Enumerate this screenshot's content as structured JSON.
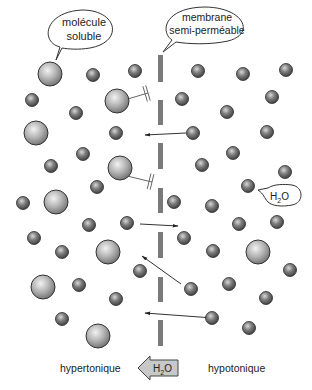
{
  "callouts": {
    "solute": {
      "line1": "molécule",
      "line2": "soluble"
    },
    "membrane": {
      "line1": "membrane",
      "line2": "semi-perméable"
    },
    "water": {
      "text": "H",
      "sub": "2",
      "tail": "O"
    }
  },
  "labels": {
    "left_side": "hypertonique",
    "right_side": "hypotonique",
    "flow_arrow": {
      "text": "H",
      "sub": "2",
      "tail": "O"
    }
  },
  "colors": {
    "membrane": "#7a7a7a",
    "large_molecule": "#a9a9a9",
    "small_molecule": "#6e6e6e",
    "arrow_fill": "#c8c8c8",
    "outline": "#333333"
  },
  "membrane": {
    "x": 158,
    "width": 5,
    "segments": [
      [
        55,
        82
      ],
      [
        100,
        125
      ],
      [
        143,
        169
      ],
      [
        188,
        213
      ],
      [
        232,
        258
      ],
      [
        277,
        302
      ],
      [
        320,
        346
      ]
    ]
  },
  "molecules": {
    "large": [
      [
        50,
        74
      ],
      [
        117,
        101
      ],
      [
        36,
        133
      ],
      [
        120,
        168
      ],
      [
        56,
        202
      ],
      [
        108,
        252
      ],
      [
        43,
        287
      ],
      [
        98,
        336
      ],
      [
        258,
        252
      ]
    ],
    "small": [
      [
        93,
        75
      ],
      [
        135,
        71
      ],
      [
        32,
        100
      ],
      [
        76,
        113
      ],
      [
        116,
        133
      ],
      [
        83,
        154
      ],
      [
        51,
        166
      ],
      [
        97,
        187
      ],
      [
        23,
        203
      ],
      [
        89,
        225
      ],
      [
        127,
        223
      ],
      [
        34,
        238
      ],
      [
        62,
        252
      ],
      [
        140,
        271
      ],
      [
        79,
        285
      ],
      [
        116,
        299
      ],
      [
        62,
        319
      ],
      [
        198,
        71
      ],
      [
        243,
        74
      ],
      [
        286,
        70
      ],
      [
        182,
        99
      ],
      [
        272,
        97
      ],
      [
        227,
        112
      ],
      [
        193,
        133
      ],
      [
        267,
        132
      ],
      [
        233,
        153
      ],
      [
        202,
        165
      ],
      [
        285,
        172
      ],
      [
        248,
        186
      ],
      [
        174,
        202
      ],
      [
        212,
        206
      ],
      [
        239,
        224
      ],
      [
        277,
        222
      ],
      [
        184,
        238
      ],
      [
        213,
        251
      ],
      [
        290,
        270
      ],
      [
        191,
        289
      ],
      [
        229,
        284
      ],
      [
        266,
        298
      ],
      [
        212,
        318
      ],
      [
        249,
        328
      ]
    ]
  },
  "arrows": {
    "blocked": [
      [
        [
          121,
          101
        ],
        [
          148,
          93
        ]
      ],
      [
        [
          123,
          175
        ],
        [
          152,
          182
        ]
      ]
    ],
    "passing": [
      [
        [
          186,
          133
        ],
        [
          145,
          135
        ]
      ],
      [
        [
          140,
          224
        ],
        [
          178,
          226
        ]
      ],
      [
        [
          181,
          284
        ],
        [
          142,
          256
        ]
      ],
      [
        [
          213,
          318
        ],
        [
          145,
          313
        ]
      ]
    ]
  }
}
